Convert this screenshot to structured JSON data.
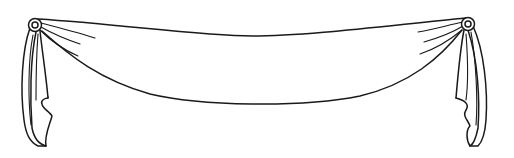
{
  "illustration": {
    "subject": "drapery swag with rosettes",
    "style": "black line art on white",
    "colors": {
      "ink": "#1a1a1a",
      "background": "#ffffff"
    },
    "parts": {
      "swag": "draped fabric swag",
      "left_rosette": "rosette",
      "right_rosette": "rosette",
      "left_tail": "hanging jabot tail",
      "right_tail": "hanging jabot tail"
    }
  }
}
